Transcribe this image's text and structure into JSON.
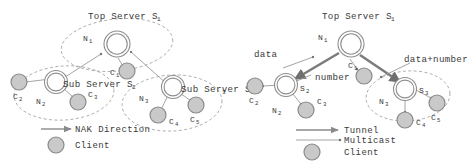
{
  "figure": {
    "title": "",
    "panels": [
      {
        "id": "left-panel",
        "name": "nak-direction-diagram",
        "top_label": {
          "main": "Top Server S",
          "sub": "1"
        },
        "group_labels": [
          {
            "main": "Sub Server S",
            "sub": "2"
          },
          {
            "main": "Sub Server S",
            "sub": "3"
          }
        ],
        "nodes": [
          {
            "id": "n1",
            "type": "network",
            "label": "N",
            "sub": "1"
          },
          {
            "id": "s1",
            "type": "server",
            "label": "",
            "sub": ""
          },
          {
            "id": "c1",
            "type": "client",
            "label": "C",
            "sub": "1"
          },
          {
            "id": "s2",
            "type": "server",
            "label": "",
            "sub": ""
          },
          {
            "id": "n2",
            "type": "network",
            "label": "N",
            "sub": "2"
          },
          {
            "id": "c2",
            "type": "client",
            "label": "C",
            "sub": "2"
          },
          {
            "id": "c3",
            "type": "client",
            "label": "C",
            "sub": "3"
          },
          {
            "id": "s3",
            "type": "server",
            "label": "",
            "sub": ""
          },
          {
            "id": "n3",
            "type": "network",
            "label": "N",
            "sub": "3"
          },
          {
            "id": "c4",
            "type": "client",
            "label": "C",
            "sub": "4"
          },
          {
            "id": "c5",
            "type": "client",
            "label": "C",
            "sub": "5"
          }
        ],
        "legend": [
          {
            "kind": "arrow",
            "label": "NAK Direction"
          },
          {
            "kind": "circle",
            "label": "Client"
          }
        ]
      },
      {
        "id": "right-panel",
        "name": "tunnel-multicast-diagram",
        "top_label": {
          "main": "Top Server S",
          "sub": "1"
        },
        "edge_labels": [
          {
            "id": "data",
            "text": "data"
          },
          {
            "id": "number",
            "text": "number"
          },
          {
            "id": "data-number",
            "text": "data+number"
          }
        ],
        "nodes": [
          {
            "id": "n1",
            "type": "network",
            "label": "N",
            "sub": "1"
          },
          {
            "id": "s1",
            "type": "server",
            "label": "",
            "sub": ""
          },
          {
            "id": "c1",
            "type": "client",
            "label": "C",
            "sub": "1"
          },
          {
            "id": "s2",
            "type": "server",
            "label": "S",
            "sub": "2"
          },
          {
            "id": "n2",
            "type": "network",
            "label": "N",
            "sub": "2"
          },
          {
            "id": "c2",
            "type": "client",
            "label": "C",
            "sub": "2"
          },
          {
            "id": "c3",
            "type": "client",
            "label": "C",
            "sub": "3"
          },
          {
            "id": "s3",
            "type": "server",
            "label": "S",
            "sub": "3"
          },
          {
            "id": "n3",
            "type": "network",
            "label": "N",
            "sub": "3"
          },
          {
            "id": "c4",
            "type": "client",
            "label": "C",
            "sub": "4"
          },
          {
            "id": "c5",
            "type": "client",
            "label": "C",
            "sub": "5"
          }
        ],
        "legend": [
          {
            "kind": "thick-arrow",
            "label": "Tunnel"
          },
          {
            "kind": "thin-arrow",
            "label": "Multicast"
          },
          {
            "kind": "circle",
            "label": "Client"
          }
        ]
      }
    ],
    "colors": {
      "client_fill": "#c9c9c9",
      "client_stroke": "#8a8a8a",
      "server_stroke": "#8e8e8e",
      "dashed_stroke": "#9a9a9a",
      "text": "#3a3a3a",
      "tunnel": "#7c7c7c",
      "background": "#ffffff"
    }
  }
}
